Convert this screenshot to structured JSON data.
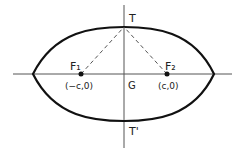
{
  "diagram": {
    "type": "lens-shaped curve with two foci and axes",
    "colors": {
      "stroke": "#111111",
      "axis": "#555555",
      "dashed": "#555555",
      "text": "#222222"
    },
    "labels": {
      "top_point": "T",
      "bottom_point": "T'",
      "center": "G",
      "focus1": "F₁",
      "focus2": "F₂",
      "focus1_coord": "(−c,0)",
      "focus2_coord": "(c,0)"
    },
    "points": {
      "center": [
        124,
        74
      ],
      "top": [
        124,
        27
      ],
      "bottom": [
        124,
        121
      ],
      "left_tip": [
        33,
        74
      ],
      "right_tip": [
        214,
        74
      ],
      "focus1": [
        81,
        74
      ],
      "focus2": [
        167,
        74
      ]
    }
  }
}
